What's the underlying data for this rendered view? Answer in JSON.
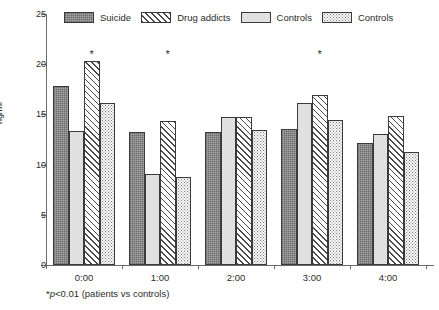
{
  "chart_data": {
    "type": "bar",
    "title": "",
    "xlabel": "",
    "ylabel": "ng/ml",
    "ylim": [
      0,
      25
    ],
    "yticks": [
      0,
      5,
      10,
      15,
      20,
      25
    ],
    "ytick_labels": [
      "0",
      "5",
      "10",
      "15",
      "20",
      "25"
    ],
    "grid": false,
    "legend_position": "top-center",
    "categories": [
      "0:00",
      "1:00",
      "2:00",
      "3:00",
      "4:00"
    ],
    "series": [
      {
        "name": "Suicide",
        "pattern": "solid-dark",
        "values": [
          17.8,
          13.2,
          13.2,
          13.5,
          12.2
        ]
      },
      {
        "name": "Controls",
        "pattern": "solid-light",
        "values": [
          13.3,
          9.1,
          14.7,
          16.1,
          13.0
        ]
      },
      {
        "name": "Drug addicts",
        "pattern": "hatch",
        "values": [
          20.3,
          14.3,
          14.7,
          16.9,
          14.8
        ]
      },
      {
        "name": "Controls",
        "pattern": "dots",
        "values": [
          16.1,
          8.8,
          13.4,
          14.4,
          11.3
        ]
      }
    ],
    "annotations": [
      {
        "text": "*",
        "category": "0:00",
        "y": 21.5
      },
      {
        "text": "*",
        "category": "1:00",
        "y": 21.5
      },
      {
        "text": "*",
        "category": "3:00",
        "y": 21.5
      }
    ],
    "footnote": "*p<0.01 (patients vs controls)",
    "footnote_parts": {
      "star": "*",
      "italic": "p",
      "rest": "<0.01 (patients vs controls)"
    }
  },
  "legend": {
    "items": [
      {
        "label": "Suicide",
        "pattern": "solid-dark"
      },
      {
        "label": "Drug addicts",
        "pattern": "hatch"
      },
      {
        "label": "Controls",
        "pattern": "solid-light"
      },
      {
        "label": "Controls",
        "pattern": "dots"
      }
    ]
  },
  "colors": {
    "axis": "#6b6b6b",
    "text": "#2b2b2b",
    "bar_outline": "#3a3a3a",
    "suicide_fill": "#a8a8a8",
    "controls_fill": "#e0e0e0",
    "hatch_line": "#4a4a4a",
    "dot_fill": "#7a7a7a",
    "background": "#ffffff"
  }
}
